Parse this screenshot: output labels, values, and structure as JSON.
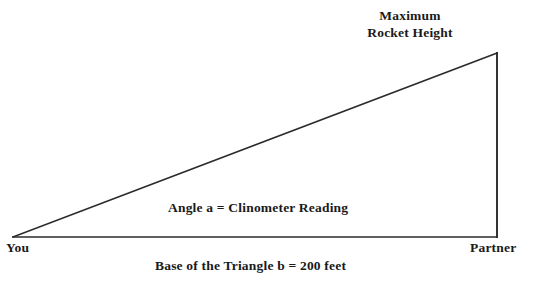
{
  "diagram": {
    "title_line1": "Maximum",
    "title_line2": "Rocket Height",
    "angle_label": "Angle a = Clinometer Reading",
    "left_vertex_label": "You",
    "right_vertex_label": "Partner",
    "base_label": "Base of the Triangle b = 200 feet",
    "line_color": "#2b2b2b",
    "text_color": "#1a1a1a",
    "background_color": "#ffffff",
    "geometry": {
      "left_vertex_x": 13,
      "left_vertex_y": 237,
      "right_vertex_x": 497,
      "right_vertex_y": 237,
      "apex_x": 497,
      "apex_y": 53,
      "base_length_feet": 200,
      "angle_name": "a"
    }
  }
}
